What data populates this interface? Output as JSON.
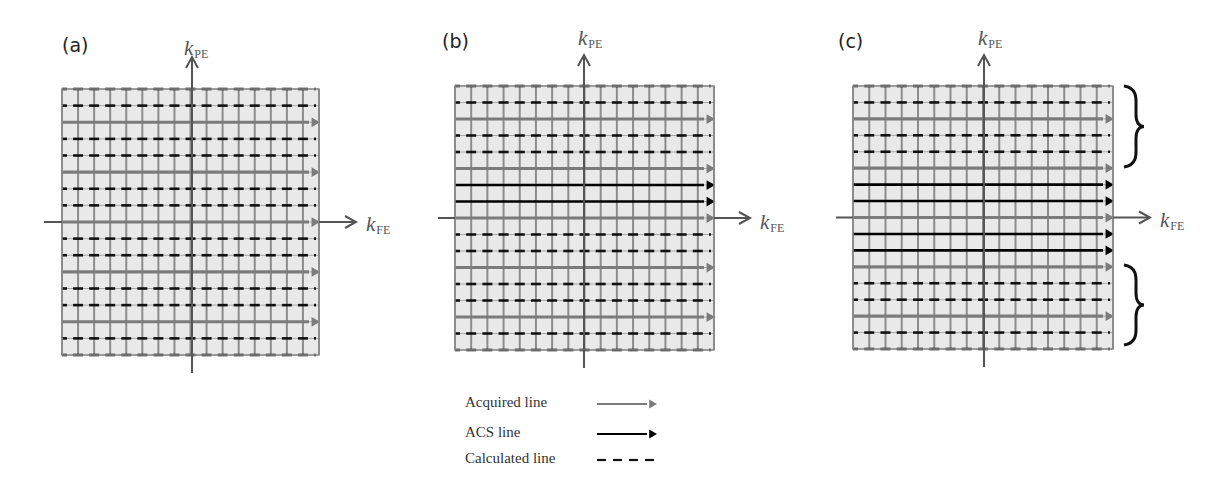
{
  "figure": {
    "panels": [
      {
        "id": "a",
        "label": "(a)",
        "label_pos": [
          62,
          44
        ],
        "grid": {
          "x0": 62,
          "y0": 89,
          "x1": 319,
          "y1": 355
        },
        "v_axis_x": 192,
        "h_axis_row": 8,
        "v_axis": {
          "top": 57,
          "bottom": 373
        },
        "h_axis": {
          "left": 44,
          "right": 356
        },
        "ylabel": {
          "main": "k",
          "sub": "PE",
          "pos": [
            184,
            36
          ]
        },
        "xlabel": {
          "main": "k",
          "sub": "FE",
          "pos": [
            366,
            212
          ]
        },
        "rows": [
          "calc",
          "calc",
          "acq",
          "calc",
          "calc",
          "acq",
          "calc",
          "calc",
          "acq",
          "calc",
          "calc",
          "acq",
          "calc",
          "calc",
          "acq",
          "calc",
          "calc"
        ],
        "braces": []
      },
      {
        "id": "b",
        "label": "(b)",
        "label_pos": [
          442,
          40
        ],
        "grid": {
          "x0": 455,
          "y0": 86,
          "x1": 714,
          "y1": 350
        },
        "v_axis_x": 584,
        "h_axis_row": 8,
        "v_axis": {
          "top": 55,
          "bottom": 368
        },
        "h_axis": {
          "left": 438,
          "right": 750
        },
        "ylabel": {
          "main": "k",
          "sub": "PE",
          "pos": [
            578,
            26
          ]
        },
        "xlabel": {
          "main": "k",
          "sub": "FE",
          "pos": [
            760,
            210
          ]
        },
        "rows": [
          "calc",
          "calc",
          "acq",
          "calc",
          "calc",
          "acq",
          "acs",
          "acs",
          "acq",
          "calc",
          "calc",
          "acq",
          "calc",
          "calc",
          "acq",
          "calc",
          "calc"
        ],
        "braces": []
      },
      {
        "id": "c",
        "label": "(c)",
        "label_pos": [
          838,
          40
        ],
        "grid": {
          "x0": 853,
          "y0": 86,
          "x1": 1113,
          "y1": 349
        },
        "v_axis_x": 984,
        "h_axis_row": 8,
        "v_axis": {
          "top": 55,
          "bottom": 367
        },
        "h_axis": {
          "left": 836,
          "right": 1150
        },
        "ylabel": {
          "main": "k",
          "sub": "PE",
          "pos": [
            978,
            26
          ]
        },
        "xlabel": {
          "main": "k",
          "sub": "FE",
          "pos": [
            1160,
            208
          ]
        },
        "rows": [
          "calc",
          "calc",
          "acq",
          "calc",
          "calc",
          "acq",
          "acs",
          "acs",
          "acq",
          "acs",
          "acs",
          "acq",
          "calc",
          "calc",
          "acq",
          "calc",
          "calc"
        ],
        "braces": [
          {
            "x": 1124,
            "y0": 86,
            "y1": 167
          },
          {
            "x": 1124,
            "y0": 265,
            "y1": 345
          }
        ]
      }
    ],
    "grid_columns": 16,
    "colors": {
      "cell_fill": "#e9e9e9",
      "grid_line": "#8c8c8c",
      "axis_line": "#555555",
      "acquired": "#7b7b7b",
      "acs": "#000000",
      "calculated": "#111111"
    },
    "legend": {
      "items": [
        {
          "label": "Acquired line",
          "style": "acq",
          "y": 404
        },
        {
          "label": "ACS line",
          "style": "acs",
          "y": 434
        },
        {
          "label": "Calculated line",
          "style": "calc",
          "y": 460
        }
      ],
      "text_x": 465,
      "line_x0": 597,
      "line_x1": 657
    }
  }
}
